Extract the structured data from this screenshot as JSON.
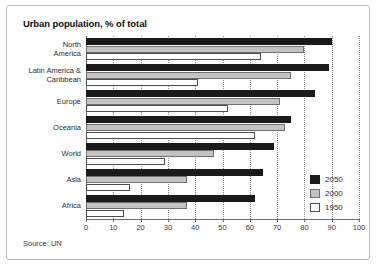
{
  "panel": {
    "title": "Urban population, % of total",
    "source": "Source: UN"
  },
  "legend": {
    "items": [
      {
        "label": "2050",
        "swatch": "black"
      },
      {
        "label": "2000",
        "swatch": "gray"
      },
      {
        "label": "1950",
        "swatch": "white"
      }
    ]
  },
  "chart_data": {
    "type": "bar",
    "orientation": "horizontal",
    "title": "Urban population, % of total",
    "xlabel": "",
    "ylabel": "",
    "xlim": [
      0,
      100
    ],
    "xticks": [
      0,
      10,
      20,
      30,
      40,
      50,
      60,
      70,
      80,
      90,
      100
    ],
    "grid": true,
    "legend_position": "bottom-right",
    "note": "Source: UN",
    "categories": [
      "North America",
      "Latin America & Caribbean",
      "Europe",
      "Oceania",
      "World",
      "Asia",
      "Africa"
    ],
    "series": [
      {
        "name": "2050",
        "color": "#1a1a1a",
        "values": [
          90,
          89,
          84,
          75,
          69,
          65,
          62
        ]
      },
      {
        "name": "2000",
        "color": "#c3c3c3",
        "values": [
          80,
          75,
          71,
          73,
          47,
          37,
          37
        ]
      },
      {
        "name": "1950",
        "color": "#ffffff",
        "values": [
          64,
          41,
          52,
          62,
          29,
          16,
          14
        ]
      }
    ]
  }
}
